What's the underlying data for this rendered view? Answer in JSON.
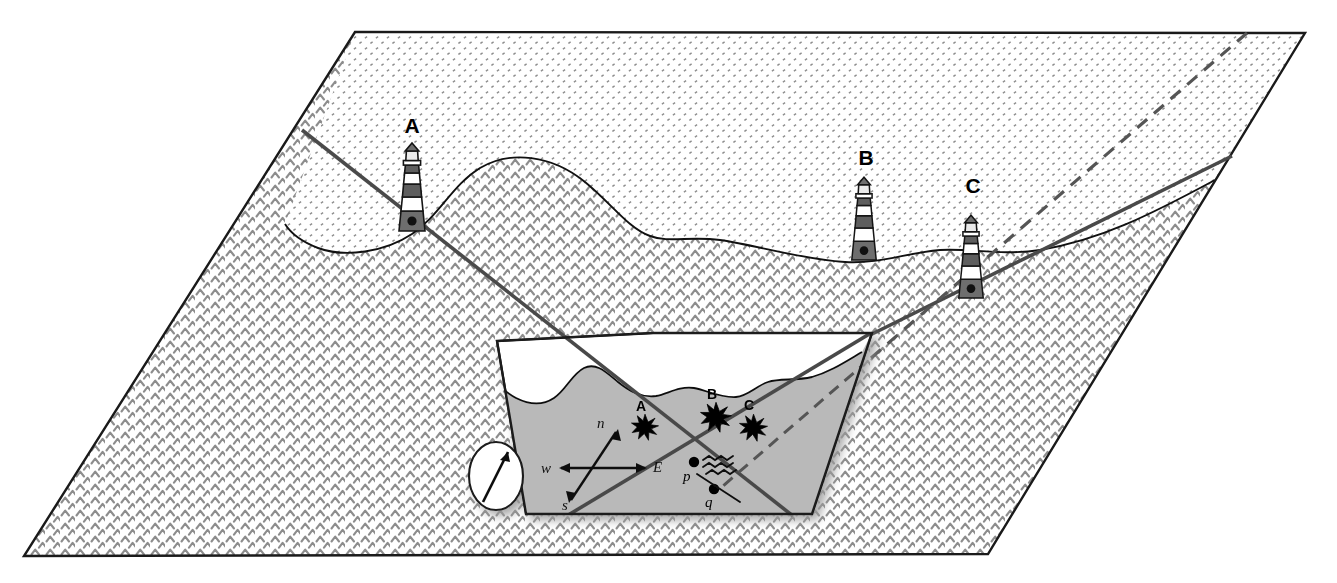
{
  "figure": {
    "type": "diagram"
  },
  "colors": {
    "outline": "#1a1a1a",
    "land_fill": "#ffffff",
    "land_dot": "#7d7d7d",
    "water_fill": "#ffffff",
    "water_chevron": "#8a8a8a",
    "inset_land": "#b9b9b9",
    "inset_water": "#ffffff",
    "sightline": "#4a4a4a",
    "dashed_line": "#5a5a5a",
    "lighthouse_band": "#5e5e5e",
    "lighthouse_light": "#e8e8e8",
    "star": "#000000",
    "shadow": "#c8c8c8"
  },
  "terrain": {
    "land_label": "land",
    "water_label": "sea",
    "land_pattern": "stipple-dots",
    "water_pattern": "chevron-waves"
  },
  "lighthouses": [
    {
      "id": "A",
      "label": "A",
      "label_x": 412,
      "label_y": 132,
      "base_x": 412,
      "base_y": 228,
      "top_y": 144,
      "scale": 1.0
    },
    {
      "id": "B",
      "label": "B",
      "label_x": 866,
      "label_y": 164,
      "base_x": 864,
      "base_y": 258,
      "top_y": 176,
      "scale": 0.95
    },
    {
      "id": "C",
      "label": "C",
      "label_x": 973,
      "label_y": 192,
      "base_x": 971,
      "base_y": 296,
      "top_y": 204,
      "scale": 0.96
    }
  ],
  "inset": {
    "name": "detail-chart",
    "corners": [
      [
        497,
        341
      ],
      [
        653,
        333
      ],
      [
        872,
        333
      ],
      [
        812,
        514
      ],
      [
        526,
        514
      ]
    ],
    "compass": {
      "name": "compass-rose",
      "center_x": 496,
      "center_y": 476,
      "rx": 27,
      "ry": 34,
      "needle_label": "north-arrow"
    },
    "direction_labels": [
      {
        "key": "n",
        "text": "n",
        "x": 597,
        "y": 428
      },
      {
        "key": "w",
        "text": "w",
        "x": 545,
        "y": 473
      },
      {
        "key": "e",
        "text": "E",
        "x": 655,
        "y": 472
      },
      {
        "key": "s",
        "text": "s",
        "x": 565,
        "y": 508
      }
    ],
    "bearing_marks": [
      {
        "id": "A",
        "label": "A",
        "x": 645,
        "y": 427,
        "label_x": 641,
        "label_y": 410
      },
      {
        "id": "B",
        "label": "B",
        "x": 716,
        "y": 417,
        "label_x": 711,
        "label_y": 400
      },
      {
        "id": "C",
        "label": "C",
        "x": 753,
        "y": 427,
        "label_x": 749,
        "label_y": 409
      }
    ],
    "points": [
      {
        "id": "p",
        "label": "p",
        "x": 694,
        "y": 463,
        "label_x": 684,
        "label_y": 480
      },
      {
        "id": "q",
        "label": "q",
        "x": 714,
        "y": 490,
        "label_x": 708,
        "label_y": 506
      }
    ],
    "current_symbol": {
      "name": "tidal-current-symbol",
      "x": 720,
      "y": 470,
      "label": "current"
    }
  },
  "sightlines": [
    {
      "id": "line-A",
      "from": "A",
      "style": "solid",
      "x1": 302,
      "y1": 132,
      "x2": 790,
      "y2": 514
    },
    {
      "id": "line-C",
      "from": "C",
      "style": "solid",
      "x1": 971,
      "y1": 296,
      "x2": 1230,
      "y2": 158
    },
    {
      "id": "line-C-inset",
      "from": "C",
      "style": "solid",
      "x1": 575,
      "y1": 514,
      "x2": 872,
      "y2": 333
    },
    {
      "id": "line-B-dashed",
      "from": "B",
      "style": "dashed",
      "x1": 1245,
      "y1": 34,
      "x2": 714,
      "y2": 490
    }
  ]
}
